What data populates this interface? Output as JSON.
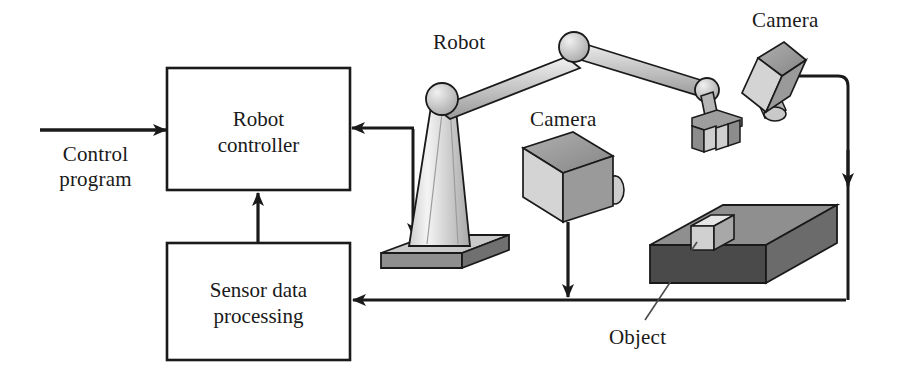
{
  "diagram": {
    "background_color": "#ffffff",
    "line_color": "#1a1a1a",
    "text_color": "#1a1a1a"
  },
  "blocks": [
    {
      "id": "robot-controller",
      "line1": "Robot",
      "line2": "controller",
      "x": 167,
      "y": 68,
      "w": 183,
      "h": 122
    },
    {
      "id": "sensor-data-processing",
      "line1": "Sensor data",
      "line2": "processing",
      "x": 167,
      "y": 243,
      "w": 183,
      "h": 117
    }
  ],
  "labels": {
    "control_program_line1": "Control",
    "control_program_line2": "program",
    "robot": "Robot",
    "camera_center": "Camera",
    "camera_right": "Camera",
    "object": "Object"
  },
  "components": {
    "robot_arm": {
      "name": "Robot",
      "shoulder_joint": [
        442,
        99
      ],
      "elbow_joint": [
        574,
        47
      ],
      "wrist_joint": [
        706,
        89
      ],
      "gripper": "u-shaped-claw",
      "base": "isometric-slab"
    },
    "camera_center": {
      "name": "Camera",
      "body": "isometric-box",
      "lens": "cylinder-right",
      "position": [
        523,
        148
      ]
    },
    "camera_right": {
      "name": "Camera",
      "body": "tilted-isometric-box",
      "lens": "cylinder-down",
      "position": [
        760,
        45
      ]
    },
    "conveyor": {
      "name": "work-surface",
      "shading": "dark-gray",
      "position": [
        660,
        205
      ]
    },
    "object_cube": {
      "name": "Object",
      "shading": "light-gray",
      "position": [
        697,
        215
      ]
    }
  },
  "colors": {
    "metal_light": "#e8e8e8",
    "metal_mid": "#b8b8b8",
    "metal_dark": "#8a8a8a",
    "conveyor_top": "#8f8f8f",
    "conveyor_front": "#4a4a4a",
    "conveyor_side": "#6b6b6b",
    "stroke": "#1a1a1a"
  },
  "connections": [
    {
      "from": "control-program-input",
      "to": "robot-controller",
      "direction": "right"
    },
    {
      "from": "robot",
      "to": "robot-controller",
      "direction": "left"
    },
    {
      "from": "robot-controller",
      "to": "robot-base",
      "direction": "down"
    },
    {
      "from": "sensor-data-processing",
      "to": "robot-controller",
      "direction": "up"
    },
    {
      "from": "camera-center",
      "to": "feedback-bus",
      "direction": "down"
    },
    {
      "from": "camera-right",
      "to": "feedback-bus",
      "direction": "down"
    },
    {
      "from": "feedback-bus",
      "to": "sensor-data-processing",
      "direction": "left"
    }
  ]
}
